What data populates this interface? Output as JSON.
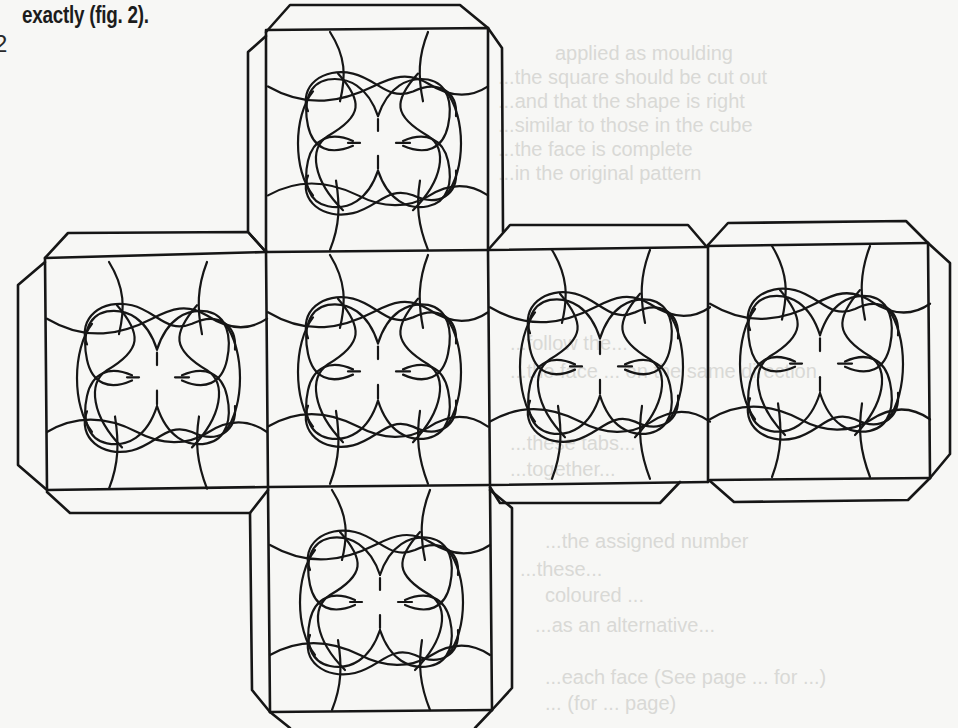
{
  "page": {
    "caption_text": "exactly (fig. 2).",
    "margin_marker": "2"
  },
  "figure": {
    "label": "fig. 2",
    "type": "cube-net",
    "faces": [
      {
        "id": "top",
        "position": "above-center"
      },
      {
        "id": "left",
        "position": "row-left"
      },
      {
        "id": "center",
        "position": "row-center"
      },
      {
        "id": "right",
        "position": "row-right"
      },
      {
        "id": "far-right",
        "position": "row-far-right"
      },
      {
        "id": "bottom",
        "position": "below-center"
      }
    ],
    "motif": "quatrefoil-knot-ornament",
    "line_color": "#161616",
    "paper_color": "#f7f7f5"
  },
  "bleed_through": {
    "color": "#d9d9d6",
    "lines": [
      "applied as moulding",
      "...the square should be cut out",
      "...and that the shape is right",
      "...similar to those in the cube",
      "...the face is complete",
      "...in the original pattern",
      "...follow the...",
      "...the face ... on the same direction",
      "...these tabs...",
      "...together...",
      "...the assigned number",
      "...these...",
      "coloured ...",
      "...as an alternative...",
      "...each face (See page ... for ...)",
      "... (for ... page)"
    ]
  }
}
